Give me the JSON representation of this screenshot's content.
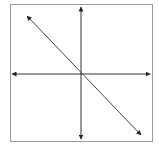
{
  "diagram": {
    "type": "coordinate-plane-graph",
    "colors": {
      "background": "#ffffff",
      "frame": "#9a9a9a",
      "axes": "#333333",
      "line": "#444444"
    },
    "frame": {
      "x": 10,
      "y": 4,
      "width": 143,
      "height": 138
    },
    "axes": {
      "x_axis": {
        "y": 74,
        "x1": 12,
        "x2": 150
      },
      "y_axis": {
        "x": 81,
        "y1": 7,
        "y2": 139
      }
    },
    "line": {
      "x1": 27,
      "y1": 16,
      "x2": 141,
      "y2": 135,
      "slope_sign": "negative",
      "through_origin": true
    }
  }
}
